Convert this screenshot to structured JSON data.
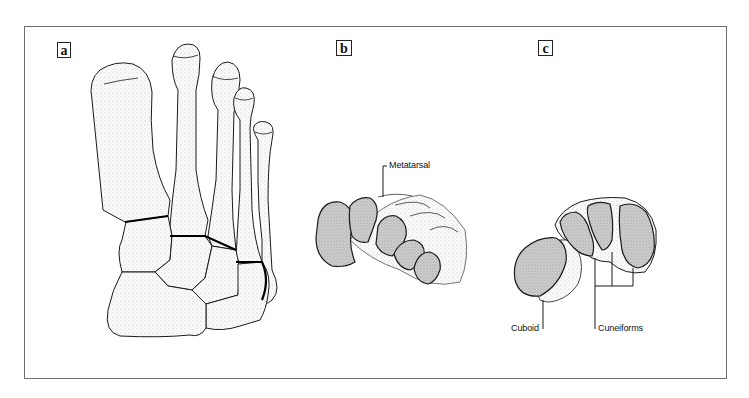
{
  "figure": {
    "panels": [
      {
        "id": "a",
        "label": "a",
        "view": "dorsal view of forefoot bones"
      },
      {
        "id": "b",
        "label": "b",
        "view": "cross-section of metatarsals"
      },
      {
        "id": "c",
        "label": "c",
        "view": "cross-section of tarsal bones"
      }
    ],
    "annotations": {
      "metatarsal": "Metatarsal",
      "cuboid": "Cuboid",
      "cuneiforms": "Cuneiforms"
    },
    "colors": {
      "frame": "#6f6f6f",
      "outline": "#1a1a1a",
      "section_fill": "#c9c9c9",
      "bone_fill": "#f4f4f4"
    }
  }
}
